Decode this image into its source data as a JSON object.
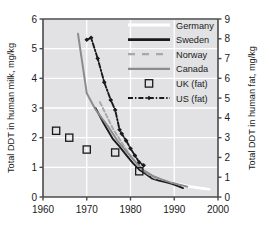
{
  "chart_data": {
    "type": "line",
    "title": "",
    "xlabel": "",
    "ylabel": "Total DDT in human milk, mg/kg",
    "y2label": "Total DDT in human fat, mg/kg",
    "xlim": [
      1960,
      2000
    ],
    "ylim": [
      0,
      6
    ],
    "y2lim": [
      0,
      9
    ],
    "xticks": [
      1960,
      1970,
      1980,
      1990,
      2000
    ],
    "yticks": [
      0,
      1,
      2,
      3,
      4,
      5,
      6
    ],
    "y2ticks": [
      0,
      1,
      2,
      3,
      4,
      5,
      6,
      7,
      8,
      9
    ],
    "grid": true,
    "grid_color": "#ffffff",
    "plot_background": "#e2e2e4",
    "legend_position": "top-right",
    "series": [
      {
        "name": "Germany",
        "axis": "left",
        "style": "solid",
        "color": "#ffffff",
        "marker": "none",
        "x": [
          1981,
          1982.5,
          1984,
          1985.5,
          1987,
          1988.5,
          1990,
          1992,
          1994,
          1996,
          1998
        ],
        "values": [
          1.05,
          0.92,
          0.78,
          0.68,
          0.6,
          0.52,
          0.46,
          0.4,
          0.34,
          0.3,
          0.26
        ]
      },
      {
        "name": "Sweden",
        "axis": "left",
        "style": "solid",
        "color": "#1a1a1a",
        "marker": "none",
        "x": [
          1972,
          1974,
          1976,
          1977.5,
          1979,
          1980.5,
          1982,
          1983.5,
          1985,
          1986.5,
          1988,
          1989.5,
          1991,
          1992
        ],
        "values": [
          3.0,
          2.45,
          1.95,
          1.7,
          1.42,
          1.15,
          0.92,
          0.78,
          0.62,
          0.55,
          0.5,
          0.44,
          0.36,
          0.3
        ]
      },
      {
        "name": "Norway",
        "axis": "left",
        "style": "dashed",
        "color": "#a8a8a8",
        "marker": "none",
        "x": [
          1973,
          1974.5,
          1976,
          1977.5,
          1979,
          1980.5,
          1982,
          1983.5,
          1985,
          1986
        ],
        "values": [
          3.2,
          2.75,
          2.3,
          1.95,
          1.6,
          1.3,
          1.0,
          0.82,
          0.68,
          0.6
        ]
      },
      {
        "name": "Canada",
        "axis": "left",
        "style": "solid",
        "color": "#8c8c8c",
        "marker": "none",
        "x": [
          1968,
          1970,
          1972,
          1975,
          1977,
          1979,
          1981,
          1983,
          1985,
          1987,
          1989,
          1991,
          1993
        ],
        "values": [
          5.5,
          3.5,
          2.95,
          2.35,
          1.9,
          1.55,
          1.2,
          0.9,
          0.72,
          0.6,
          0.5,
          0.42,
          0.35
        ]
      },
      {
        "name": "UK (fat)",
        "axis": "right",
        "style": "none",
        "color": "#1a1a1a",
        "marker": "open-square",
        "x": [
          1963,
          1966,
          1970,
          1976.5,
          1982
        ],
        "values": [
          3.35,
          3.0,
          2.4,
          2.25,
          1.3
        ]
      },
      {
        "name": "US (fat)",
        "axis": "right",
        "style": "dash-dot",
        "color": "#1a1a1a",
        "marker": "diamond",
        "x": [
          1970,
          1971,
          1972.5,
          1974,
          1975.5,
          1976.5,
          1977.5,
          1978,
          1979,
          1980,
          1981,
          1982,
          1983
        ],
        "values": [
          7.95,
          8.05,
          7.0,
          5.8,
          4.9,
          4.4,
          3.4,
          3.2,
          2.85,
          2.45,
          2.1,
          1.75,
          1.6
        ]
      }
    ]
  },
  "axes": {
    "left_title": "Total DDT in human milk, mg/kg",
    "right_title": "Total DDT in human fat, mg/kg",
    "x_ticks": [
      "1960",
      "1970",
      "1980",
      "1990",
      "2000"
    ],
    "y_left_ticks": [
      "6",
      "5",
      "4",
      "3",
      "2",
      "1",
      "0"
    ],
    "y_right_ticks": [
      "9",
      "8",
      "7",
      "6",
      "5",
      "4",
      "3",
      "2",
      "1",
      "0"
    ]
  },
  "legend": {
    "items": [
      {
        "label": "Germany",
        "sample": "line-white"
      },
      {
        "label": "Sweden",
        "sample": "line-black-solid"
      },
      {
        "label": "Norway",
        "sample": "line-gray-dashed"
      },
      {
        "label": "Canada",
        "sample": "line-gray-solid"
      },
      {
        "label": "UK (fat)",
        "sample": "marker-open-square"
      },
      {
        "label": "US (fat)",
        "sample": "line-black-dashdot-diamond"
      }
    ]
  }
}
